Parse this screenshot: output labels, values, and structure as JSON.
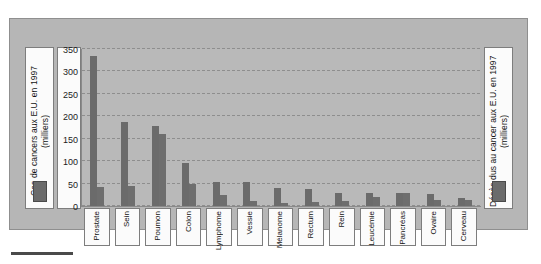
{
  "chart_data": {
    "type": "bar",
    "title": "",
    "subtitle": "",
    "xlabel": "",
    "ylabel": "Cas de cancers aux E.U. en 1997 (milliers)",
    "y2label": "Décès dus au cancer aux E.U. en 1997 (milliers)",
    "ylim": [
      0,
      350
    ],
    "yticks": [
      0,
      50,
      100,
      150,
      200,
      250,
      300,
      350
    ],
    "ytick_labels": [
      "0",
      "50",
      "100",
      "150",
      "200",
      "250",
      "300",
      "350"
    ],
    "grid": true,
    "grid_style": "dashed",
    "legend_position": "outside-left-and-right",
    "categories": [
      "Prostate",
      "Sein",
      "Poumon",
      "Colon",
      "Lymphome",
      "Vessie",
      "Mélanome",
      "Rectum",
      "Rein",
      "Leucémie",
      "Pancréas",
      "Ovaire",
      "Cerveau"
    ],
    "series": [
      {
        "name": "Cas de cancers aux E.U. en 1997 (milliers)",
        "color": "#6b6b6b",
        "values": [
          334,
          188,
          178,
          95,
          54,
          53,
          41,
          39,
          29,
          28,
          28,
          26,
          17
        ]
      },
      {
        "name": "Décès dus au cancer aux E.U. en 1997 (milliers)",
        "color": "#6e6e6e",
        "values": [
          42,
          44,
          160,
          48,
          25,
          12,
          7,
          8,
          11,
          21,
          28,
          14,
          13
        ]
      }
    ]
  },
  "axis": {
    "left_legend_label": "Cas de cancers aux E.U. en 1997 (milliers)",
    "right_legend_label": "Décès dus au cancer aux E.U. en 1997 (milliers)"
  },
  "colors": {
    "bar": "#6b6b6b",
    "plot_background": "#b9b9b9",
    "frame_background": "#b6b6b6",
    "panel_background": "#fbfbfb",
    "gridline": "#8e8e8e",
    "text": "#141414"
  }
}
